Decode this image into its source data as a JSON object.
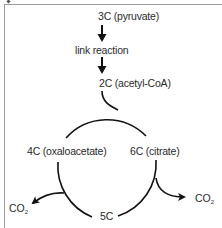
{
  "diagram": {
    "nodes": {
      "pyruvate": "3C (pyruvate)",
      "link_reaction": "link reaction",
      "acetyl_coa": "2C (acetyl-CoA)",
      "oxaloacetate": "4C (oxaloacetate)",
      "citrate": "6C (citrate)",
      "five_carbon": "5C"
    },
    "outputs": {
      "co2_left": {
        "base": "CO",
        "subscript": "2"
      },
      "co2_right": {
        "base": "CO",
        "subscript": "2"
      }
    },
    "edges": [
      {
        "from": "3C (pyruvate)",
        "to": "link reaction"
      },
      {
        "from": "link reaction",
        "to": "2C (acetyl-CoA)"
      },
      {
        "from": "2C (acetyl-CoA)",
        "to": "cycle (joins 4C to form 6C)"
      },
      {
        "from": "6C (citrate)",
        "to": "5C",
        "releases": "CO2"
      },
      {
        "from": "5C",
        "to": "4C (oxaloacetate)",
        "releases": "CO2"
      },
      {
        "from": "4C (oxaloacetate)",
        "to": "6C (citrate)"
      }
    ],
    "colors": {
      "line": "#111111",
      "text": "#2b2b2b",
      "frame": "#9a9a9a"
    }
  }
}
